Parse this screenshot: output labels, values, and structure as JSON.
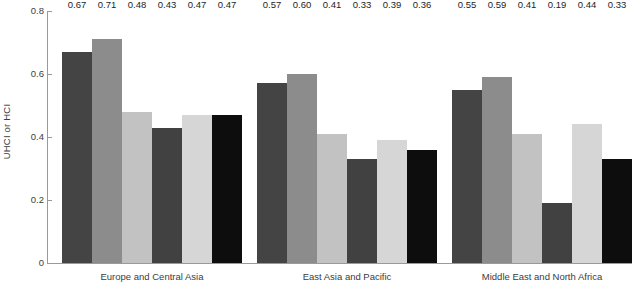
{
  "chart_data": {
    "type": "bar",
    "title": "",
    "xlabel": "",
    "ylabel": "UHCI or HCI",
    "ylim": [
      0,
      0.8
    ],
    "ytick_labels": [
      "0",
      "0.2",
      "0.4",
      "0.6",
      "0.8"
    ],
    "ytick_values": [
      0,
      0.2,
      0.4,
      0.6,
      0.8
    ],
    "grid": false,
    "legend": "none",
    "value_label_format": "0.00",
    "categories": [
      "Europe and Central Asia",
      "East Asia and Pacific",
      "Middle East and North Africa"
    ],
    "series": [
      {
        "name": "series-1",
        "color": "#444444",
        "values": [
          0.67,
          0.57,
          0.55
        ]
      },
      {
        "name": "series-2",
        "color": "#8c8c8c",
        "values": [
          0.71,
          0.6,
          0.59
        ]
      },
      {
        "name": "series-3",
        "color": "#c2c2c2",
        "values": [
          0.48,
          0.41,
          0.41
        ]
      },
      {
        "name": "series-4",
        "color": "#414141",
        "values": [
          0.43,
          0.33,
          0.19
        ]
      },
      {
        "name": "series-5",
        "color": "#d6d6d6",
        "values": [
          0.47,
          0.39,
          0.44
        ]
      },
      {
        "name": "series-6",
        "color": "#0d0d0d",
        "values": [
          0.47,
          0.36,
          0.33
        ]
      }
    ],
    "value_labels": [
      [
        "0.67",
        "0.71",
        "0.48",
        "0.43",
        "0.47",
        "0.47"
      ],
      [
        "0.57",
        "0.60",
        "0.41",
        "0.33",
        "0.39",
        "0.36"
      ],
      [
        "0.55",
        "0.59",
        "0.41",
        "0.19",
        "0.44",
        "0.33"
      ]
    ]
  }
}
